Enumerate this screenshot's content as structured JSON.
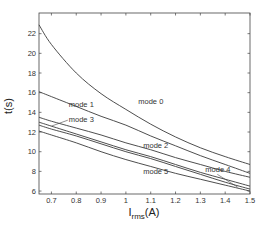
{
  "chart_data": {
    "type": "line",
    "title": "",
    "xlabel": "I_rms(A)",
    "xlabel_main": "I",
    "xlabel_sub": "rms",
    "xlabel_unit": "(A)",
    "ylabel": "t(s)",
    "xlim": [
      0.65,
      1.5
    ],
    "ylim": [
      5.7,
      24.1
    ],
    "grid": false,
    "legend": "inline labels",
    "x_ticks": [
      0.7,
      0.8,
      0.9,
      1,
      1.1,
      1.2,
      1.3,
      1.4,
      1.5
    ],
    "x_tick_labels": [
      "0.7",
      "0.8",
      "0.9",
      "1",
      "1.1",
      "1.2",
      "1.3",
      "1.4",
      "1.5"
    ],
    "y_ticks": [
      6,
      8,
      10,
      12,
      14,
      16,
      18,
      20,
      22
    ],
    "y_tick_labels": [
      "6",
      "8",
      "10",
      "12",
      "14",
      "16",
      "18",
      "20",
      "22"
    ],
    "x": [
      0.65,
      0.7,
      0.8,
      0.9,
      1.0,
      1.1,
      1.2,
      1.3,
      1.4,
      1.5
    ],
    "series": [
      {
        "name": "mode 0",
        "values": [
          22.9,
          20.9,
          18.0,
          15.9,
          14.3,
          12.8,
          11.5,
          10.4,
          9.5,
          8.7
        ],
        "label_pos": [
          1.05,
          14.9
        ]
      },
      {
        "name": "mode 1",
        "values": [
          16.1,
          15.6,
          14.6,
          13.6,
          12.7,
          11.6,
          10.6,
          9.6,
          8.7,
          7.8
        ],
        "label_pos": [
          0.77,
          14.5
        ]
      },
      {
        "name": "mode 2",
        "values": [
          13.5,
          13.1,
          12.4,
          11.7,
          10.9,
          10.2,
          9.4,
          8.7,
          8.0,
          7.4
        ],
        "label_pos": [
          1.07,
          10.4
        ]
      },
      {
        "name": "mode 3",
        "values": [
          13.0,
          12.6,
          11.8,
          11.0,
          10.2,
          9.5,
          8.7,
          7.9,
          7.2,
          6.5
        ],
        "label_pos": [
          0.77,
          13.0
        ],
        "leader_to": [
          0.7,
          12.6
        ]
      },
      {
        "name": "mode 4",
        "values": [
          12.7,
          12.3,
          11.6,
          10.8,
          10.0,
          9.3,
          8.5,
          7.7,
          6.9,
          6.2
        ],
        "label_pos": [
          1.32,
          7.9
        ],
        "leader_to": [
          1.45,
          6.4
        ]
      },
      {
        "name": "mode 5",
        "values": [
          12.1,
          11.7,
          10.9,
          10.0,
          9.2,
          8.5,
          7.8,
          7.2,
          6.6,
          6.0
        ],
        "label_pos": [
          1.07,
          7.7
        ]
      }
    ]
  }
}
